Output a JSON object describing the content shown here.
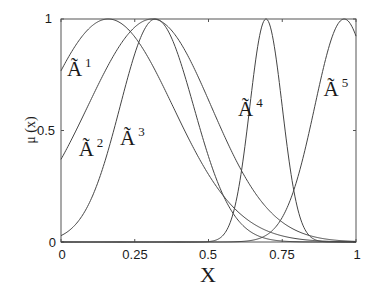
{
  "chart_data": {
    "type": "line",
    "title": "",
    "xlabel": "X",
    "ylabel": "μ (x)",
    "xlim": [
      0,
      1
    ],
    "ylim": [
      0,
      1
    ],
    "grid": false,
    "x_ticks": [
      "0",
      "0.25",
      "0.5",
      "0.75",
      "1"
    ],
    "y_ticks": [
      "0",
      "0.5",
      "1"
    ],
    "series": [
      {
        "name": "Ã1",
        "label_base": "Ã",
        "label_sup": "1",
        "shape": "gaussian",
        "center": 0.16,
        "sigma_left": 0.22,
        "sigma_right": 0.22,
        "value_at_0": 0.76
      },
      {
        "name": "Ã2",
        "label_base": "Ã",
        "label_sup": "2",
        "shape": "gaussian",
        "center": 0.31,
        "sigma_left": 0.22,
        "sigma_right": 0.2,
        "value_at_0": 0.37
      },
      {
        "name": "Ã3",
        "label_base": "Ã",
        "label_sup": "3",
        "shape": "gaussian",
        "center": 0.32,
        "sigma_left": 0.12,
        "sigma_right": 0.13,
        "value_at_0": 0.03
      },
      {
        "name": "Ã4",
        "label_base": "Ã",
        "label_sup": "4",
        "shape": "gaussian",
        "center": 0.695,
        "sigma_left": 0.055,
        "sigma_right": 0.055,
        "value_at_0": 0.0
      },
      {
        "name": "Ã5",
        "label_base": "Ã",
        "label_sup": "5",
        "shape": "gaussian",
        "center": 0.96,
        "sigma_left": 0.1,
        "sigma_right": 0.1,
        "value_at_0": 0.0
      }
    ],
    "annotations": [
      {
        "text": "Ã1",
        "x": 0.02,
        "y": 0.78
      },
      {
        "text": "Ã2",
        "x": 0.06,
        "y": 0.42
      },
      {
        "text": "Ã3",
        "x": 0.2,
        "y": 0.47
      },
      {
        "text": "Ã4",
        "x": 0.6,
        "y": 0.6
      },
      {
        "text": "Ã5",
        "x": 0.89,
        "y": 0.69
      }
    ],
    "legend": "none (inline labels)"
  }
}
